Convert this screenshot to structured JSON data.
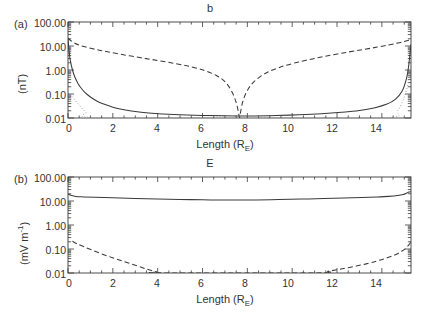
{
  "figure": {
    "background": "#ffffff",
    "ink": "#3a3a3a"
  },
  "panels": [
    {
      "tag": "(a)",
      "title": "b",
      "ylabel_main": "(nT)",
      "xlabel_main": "Length (R",
      "xlabel_sub": "E",
      "xlabel_tail": ")",
      "ytick_labels": [
        "100.00",
        "10.00",
        "1.00",
        "0.10",
        "0.01"
      ],
      "xtick_labels": [
        "0",
        "2",
        "4",
        "6",
        "8",
        "10",
        "12",
        "14"
      ]
    },
    {
      "tag": "(b)",
      "title": "E",
      "ylabel_pre": "(mV m",
      "ylabel_sup": "-1",
      "ylabel_post": ")",
      "xlabel_main": "Length (R",
      "xlabel_sub": "E",
      "xlabel_tail": ")",
      "ytick_labels": [
        "100.00",
        "10.00",
        "1.00",
        "0.10",
        "0.01"
      ],
      "xtick_labels": [
        "0",
        "2",
        "4",
        "6",
        "8",
        "10",
        "12",
        "14"
      ]
    }
  ],
  "chart_data": [
    {
      "type": "line",
      "panel": "(a)",
      "title": "b",
      "xlabel": "Length (R_E)",
      "ylabel": "(nT)",
      "xlim": [
        0,
        15.3
      ],
      "ylim": [
        0.01,
        100.0
      ],
      "yscale": "log",
      "xscale": "linear",
      "grid": false,
      "legend": "none",
      "xticks": [
        0,
        2,
        4,
        6,
        8,
        10,
        12,
        14
      ],
      "yticks": [
        0.01,
        0.1,
        1.0,
        10.0,
        100.0
      ],
      "series": [
        {
          "name": "solid",
          "style": "solid",
          "x": [
            0.0,
            0.05,
            0.1,
            0.2,
            0.3,
            0.45,
            0.6,
            0.8,
            1.0,
            1.3,
            1.6,
            2.0,
            2.5,
            3.0,
            3.6,
            4.2,
            5.0,
            6.0,
            7.0,
            7.65,
            8.3,
            9.3,
            10.3,
            11.3,
            12.2,
            13.0,
            13.7,
            14.2,
            14.6,
            14.9,
            15.1,
            15.2,
            15.3
          ],
          "y": [
            20.0,
            6.0,
            2.6,
            1.0,
            0.52,
            0.27,
            0.17,
            0.105,
            0.075,
            0.05,
            0.038,
            0.028,
            0.022,
            0.0185,
            0.0162,
            0.0148,
            0.0137,
            0.0128,
            0.0123,
            0.0121,
            0.0122,
            0.0127,
            0.0136,
            0.015,
            0.0172,
            0.0205,
            0.027,
            0.037,
            0.06,
            0.13,
            0.45,
            1.6,
            12.0
          ]
        },
        {
          "name": "dashed",
          "style": "dashed",
          "x": [
            0.0,
            0.3,
            0.8,
            1.5,
            2.3,
            3.2,
            4.0,
            4.8,
            5.5,
            6.1,
            6.6,
            7.0,
            7.3,
            7.5,
            7.6,
            7.65,
            7.7,
            7.8,
            8.0,
            8.3,
            8.8,
            9.4,
            10.1,
            10.9,
            11.7,
            12.5,
            13.2,
            13.8,
            14.3,
            14.7,
            15.0,
            15.2,
            15.3
          ],
          "y": [
            21.0,
            13.0,
            9.0,
            6.4,
            4.6,
            3.3,
            2.5,
            1.85,
            1.35,
            0.95,
            0.6,
            0.33,
            0.13,
            0.045,
            0.018,
            0.0105,
            0.018,
            0.05,
            0.14,
            0.33,
            0.72,
            1.25,
            1.95,
            2.9,
            4.1,
            5.6,
            7.2,
            9.0,
            11.0,
            13.2,
            15.5,
            17.5,
            19.0
          ]
        },
        {
          "name": "dotted",
          "style": "dotted",
          "x": [
            0.0,
            0.2,
            0.4,
            0.6,
            0.8,
            1.0,
            5.5,
            6.2,
            6.8,
            7.2,
            7.5,
            7.65,
            7.8,
            8.1,
            8.5,
            9.0,
            9.6,
            14.3,
            14.7,
            15.0,
            15.2,
            15.3
          ],
          "y": [
            0.12,
            0.075,
            0.045,
            0.027,
            0.017,
            0.0105,
            0.0102,
            0.0107,
            0.0115,
            0.0123,
            0.0129,
            0.0131,
            0.0129,
            0.0122,
            0.0114,
            0.0106,
            0.0101,
            0.0105,
            0.02,
            0.075,
            0.35,
            1.6
          ]
        }
      ]
    },
    {
      "type": "line",
      "panel": "(b)",
      "title": "E",
      "xlabel": "Length (R_E)",
      "ylabel": "(mV m^-1)",
      "xlim": [
        0,
        15.3
      ],
      "ylim": [
        0.01,
        100.0
      ],
      "yscale": "log",
      "xscale": "linear",
      "grid": false,
      "legend": "none",
      "xticks": [
        0,
        2,
        4,
        6,
        8,
        10,
        12,
        14
      ],
      "yticks": [
        0.01,
        0.1,
        1.0,
        10.0,
        100.0
      ],
      "series": [
        {
          "name": "solid",
          "style": "solid",
          "x": [
            0.0,
            0.15,
            0.35,
            0.7,
            1.2,
            2.0,
            3.0,
            4.0,
            5.0,
            6.0,
            7.0,
            7.6,
            8.4,
            9.4,
            10.4,
            11.4,
            12.3,
            13.1,
            13.8,
            14.3,
            14.7,
            14.95,
            15.1,
            15.2,
            15.3
          ],
          "y": [
            19.5,
            17.0,
            15.4,
            14.8,
            14.3,
            13.6,
            12.8,
            12.1,
            11.6,
            11.2,
            11.0,
            10.95,
            11.1,
            11.5,
            12.0,
            12.6,
            13.3,
            14.0,
            14.8,
            15.6,
            16.8,
            18.5,
            21.0,
            23.5,
            24.5
          ]
        },
        {
          "name": "dashed",
          "style": "dashed",
          "x": [
            0.2,
            0.4,
            0.7,
            1.1,
            1.6,
            2.1,
            2.6,
            3.1,
            3.55,
            3.95,
            4.2,
            11.1,
            11.6,
            12.1,
            12.7,
            13.3,
            13.8,
            14.2,
            14.6,
            14.9,
            15.1,
            15.25,
            15.3
          ],
          "y": [
            0.21,
            0.165,
            0.125,
            0.088,
            0.058,
            0.04,
            0.028,
            0.0195,
            0.0142,
            0.0112,
            0.0101,
            0.0101,
            0.0118,
            0.0142,
            0.0182,
            0.024,
            0.032,
            0.042,
            0.058,
            0.082,
            0.115,
            0.17,
            0.21
          ]
        }
      ]
    }
  ]
}
